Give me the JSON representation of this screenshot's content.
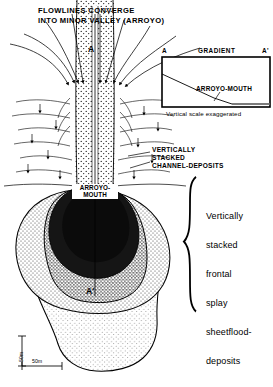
{
  "figure": {
    "type": "geological-block-diagram"
  },
  "header": {
    "line1": "FLOWLINES CONVERGE",
    "line2": "INTO MINOR VALLEY (ARROYO)"
  },
  "map": {
    "axis_top_label": "A",
    "axis_bottom_label": "A'",
    "arroyo_mouth_line1": "ARROYO-",
    "arroyo_mouth_line2": "MOUTH",
    "channel_annotation": {
      "line1": "VERTICALLY",
      "line2": "STACKED",
      "line3": "CHANNEL-DEPOSITS"
    }
  },
  "inset": {
    "left_label": "A",
    "right_label": "A'",
    "title": "GRADIENT",
    "profile_label": "ARROYO-MOUTH",
    "caption": "Vertical scale exaggerated"
  },
  "brace_label": {
    "lines": [
      "Vertically",
      "stacked",
      "frontal",
      "splay",
      "sheetflood-",
      "deposits"
    ]
  },
  "scale_bar": {
    "vertical": "50m",
    "horizontal": "50m"
  },
  "colors": {
    "ink": "#000000",
    "paper": "#ffffff",
    "channel_dark": "#1a1a1a",
    "lobe_mid": "#6e6e6e",
    "lobe_light": "#bdbdbd",
    "lobe_pale": "#d8d8d8"
  }
}
